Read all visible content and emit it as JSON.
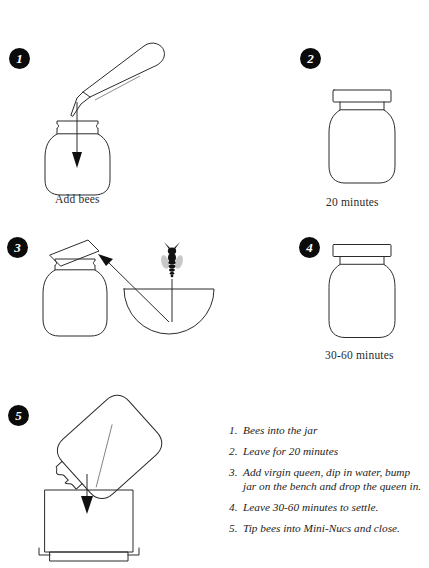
{
  "document": {
    "title": "Bee Jar Mini-Nuc Preparation Diagram",
    "background_color": "#ffffff",
    "ink_color": "#2b2b2b"
  },
  "steps": [
    {
      "number": "1",
      "caption": "Add bees",
      "figure_name": "jar-with-pouring-jar",
      "description": "Open jar with a tilted jar above pouring bees in, downward arrow"
    },
    {
      "number": "2",
      "caption": "20 minutes",
      "figure_name": "closed-jar",
      "description": "Jar with flat lid closed"
    },
    {
      "number": "3",
      "caption": "",
      "figure_name": "jar-lid-ajar-bee-water-bowl",
      "description": "Jar with lid askew, bee above a half-round water bowl, arrow from bowl to jar mouth"
    },
    {
      "number": "4",
      "caption": "30-60 minutes",
      "figure_name": "closed-jar",
      "description": "Jar with flat lid closed"
    },
    {
      "number": "5",
      "caption": "",
      "figure_name": "jar-tipping-into-mini-nuc",
      "description": "Tilted jar pouring down into an open mini-nuc box"
    }
  ],
  "instructions": {
    "items": [
      {
        "number": "1.",
        "text": "Bees into the jar"
      },
      {
        "number": "2.",
        "text": "Leave for 20 minutes"
      },
      {
        "number": "3.",
        "text": "Add virgin queen, dip in water, bump jar on the bench and drop the queen in."
      },
      {
        "number": "4.",
        "text": "Leave 30-60 minutes to settle."
      },
      {
        "number": "5.",
        "text": "Tip bees into Mini-Nucs and close."
      }
    ]
  }
}
